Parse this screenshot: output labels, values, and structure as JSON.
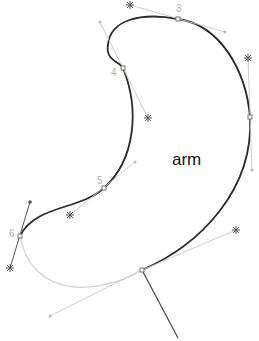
{
  "diagram": {
    "shape_label": "arm",
    "colors": {
      "path_active": "#2a2a2a",
      "path_inactive": "#cfcfcf",
      "handle_line": "#c8c8c8",
      "handle_star": "#555555",
      "anchor": "#666666",
      "label": "#b0b0b0"
    },
    "point_labels": [
      {
        "id": "3",
        "text": "3"
      },
      {
        "id": "4",
        "text": "4"
      },
      {
        "id": "5",
        "text": "5"
      },
      {
        "id": "6",
        "text": "6"
      }
    ]
  }
}
